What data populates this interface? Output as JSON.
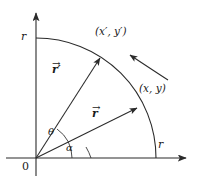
{
  "figure": {
    "background_color": "#ffffff",
    "stroke_color": "#2b2b2b",
    "text_color": "#1a1a1a",
    "axes": {
      "origin_label": "0",
      "y_axis_r_label": "r",
      "x_axis_r_label": "r",
      "origin_px": {
        "x": 36,
        "y": 158
      },
      "x_axis_end_px": {
        "x": 188,
        "y": 158
      },
      "y_axis_end_px": {
        "x": 36,
        "y": 11
      },
      "radius_px": 120
    },
    "arc": {
      "description": "quarter circle of radius r in first quadrant",
      "start_px": {
        "x": 36,
        "y": 38
      },
      "end_px": {
        "x": 156,
        "y": 158
      }
    },
    "vectors": [
      {
        "name": "r-prime-vector",
        "label": "r",
        "prime": "′",
        "overset": "→",
        "angle_label": "θ",
        "tip_px": {
          "x": 101,
          "y": 59
        },
        "label_px": {
          "x": 54,
          "y": 66
        }
      },
      {
        "name": "r-vector",
        "label": "r",
        "prime": "",
        "overset": "→",
        "angle_label": "α",
        "tip_px": {
          "x": 138,
          "y": 109
        },
        "label_px": {
          "x": 93,
          "y": 110
        }
      }
    ],
    "angles": [
      {
        "name": "theta",
        "symbol": "θ",
        "between": "r-prime-vector and x-axis",
        "label_px": {
          "x": 49,
          "y": 133
        }
      },
      {
        "name": "alpha",
        "symbol": "α",
        "between": "r-vector and x-axis",
        "label_px": {
          "x": 65,
          "y": 146
        }
      }
    ],
    "point_labels": [
      {
        "name": "rotated-point",
        "text": "(x′, y′)",
        "px": {
          "x": 103,
          "y": 32
        }
      },
      {
        "name": "original-point",
        "text": "(x, y)",
        "px": {
          "x": 142,
          "y": 88
        }
      }
    ],
    "rotation_arrow": {
      "name": "rotation-direction-arrow",
      "direction": "counterclockwise",
      "from_px": {
        "x": 168,
        "y": 80
      },
      "to_px": {
        "x": 128,
        "y": 53
      }
    }
  }
}
